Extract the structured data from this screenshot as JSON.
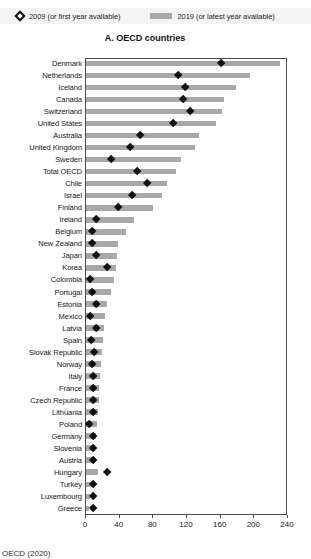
{
  "legend": {
    "items": [
      {
        "label": "2009 (or first year available)",
        "marker": "diamond-marker-icon",
        "color": "#111111"
      },
      {
        "label": "2019 (or latest year available)",
        "marker": "bar-swatch-icon",
        "color": "#a8a8a8"
      }
    ]
  },
  "source_note": "OECD (2020)",
  "chart_data": {
    "type": "bar",
    "orientation": "horizontal",
    "title": "A. OECD countries",
    "xlabel": "",
    "ylabel": "",
    "xlim": [
      0,
      240
    ],
    "xticks": [
      0,
      40,
      80,
      120,
      160,
      200,
      240
    ],
    "grid": false,
    "legend_position": "top",
    "categories": [
      "Denmark",
      "Netherlands",
      "Iceland",
      "Canada",
      "Switzerland",
      "United States",
      "Australia",
      "United Kingdom",
      "Sweden",
      "Total OECD",
      "Chile",
      "Israel",
      "Finland",
      "Ireland",
      "Belgium",
      "New Zealand",
      "Japan",
      "Korea",
      "Colombia",
      "Portugal",
      "Estonia",
      "Mexico",
      "Latvia",
      "Spain",
      "Slovak Republic",
      "Norway",
      "Italy",
      "France",
      "Czech Republic",
      "Lithuania",
      "Poland",
      "Germany",
      "Slovenia",
      "Austria",
      "Hungary",
      "Turkey",
      "Luxembourg",
      "Greece"
    ],
    "series": [
      {
        "name": "2019 (or latest year available)",
        "type": "bar",
        "color": "#a8a8a8",
        "values": [
          231,
          195,
          178,
          164,
          162,
          155,
          134,
          130,
          113,
          107,
          96,
          90,
          80,
          57,
          48,
          38,
          37,
          36,
          33,
          30,
          25,
          23,
          21,
          20,
          19,
          18,
          17,
          16,
          15,
          14,
          13,
          12,
          11,
          10,
          14,
          6,
          5,
          4
        ]
      },
      {
        "name": "2009 (or first year available)",
        "type": "scatter",
        "color": "#121212",
        "values": [
          161,
          109,
          118,
          115,
          124,
          104,
          64,
          52,
          30,
          61,
          73,
          55,
          38,
          12,
          7,
          7,
          12,
          25,
          5,
          7,
          12,
          5,
          12,
          6,
          10,
          7,
          8,
          9,
          9,
          9,
          4,
          9,
          9,
          9,
          25,
          8,
          9,
          9
        ]
      }
    ]
  }
}
